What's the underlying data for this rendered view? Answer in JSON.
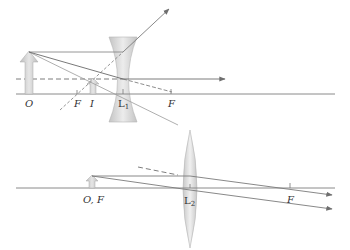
{
  "diagram": {
    "colors": {
      "axis": "#8a8a8a",
      "ray": "#7a7a7a",
      "arrowhead": "#6e6e6e",
      "lens_fill": "#d7d7d7",
      "lens_edge": "#b0b0b0",
      "object_fill": "#cfcfcf",
      "label": "#333333"
    },
    "top_panel": {
      "labels": {
        "object": "O",
        "focal_left": "F",
        "image": "I",
        "lens_main": "L",
        "lens_sub": "1",
        "focal_right": "F"
      },
      "lens_type": "diverging (concave)"
    },
    "bottom_panel": {
      "labels": {
        "object_focal": "O, F",
        "lens_main": "L",
        "lens_sub": "2",
        "focal_right": "F"
      },
      "lens_type": "converging (convex)"
    }
  }
}
